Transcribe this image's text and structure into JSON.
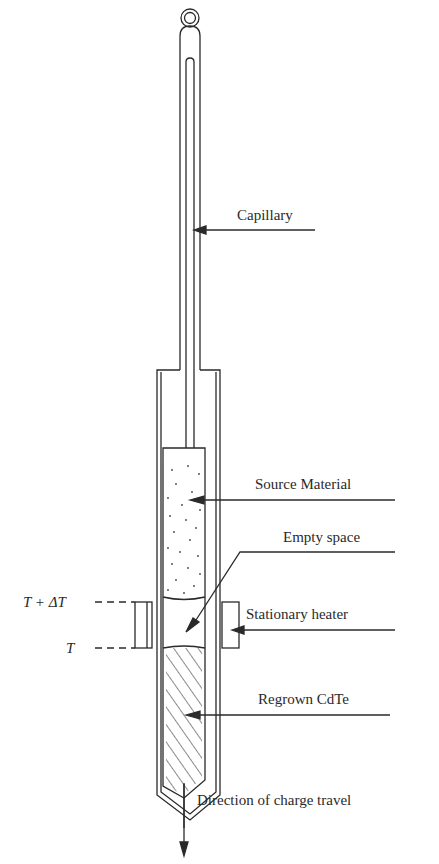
{
  "figure": {
    "type": "ampoule-growth-diagram",
    "labels": {
      "capillary": "Capillary",
      "source": "Source Material",
      "empty": "Empty space",
      "heater": "Stationary heater",
      "regrown": "Regrown CdTe",
      "direction": "Direction of charge travel",
      "t_high": "T + ΔT",
      "t_low": "T"
    },
    "colors": {
      "line": "#2a2a2a",
      "background": "#ffffff"
    }
  }
}
